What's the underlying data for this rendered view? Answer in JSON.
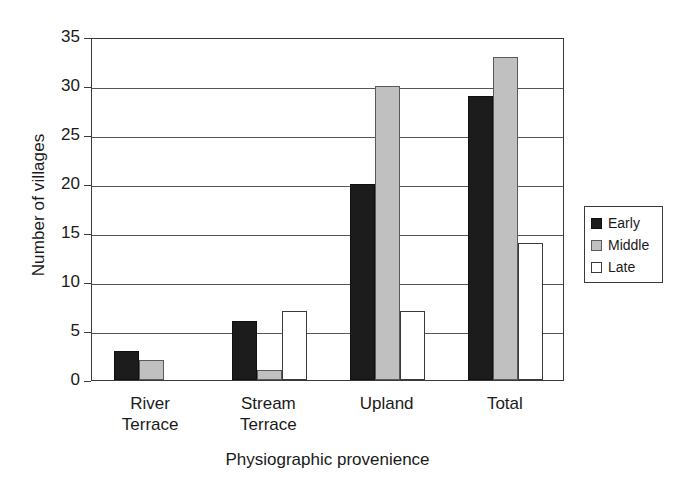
{
  "chart_data": {
    "type": "bar",
    "title": "",
    "xlabel": "Physiographic provenience",
    "ylabel": "Number of villages",
    "categories": [
      "River\nTerrace",
      "Stream\nTerrace",
      "Upland",
      "Total"
    ],
    "series": [
      {
        "name": "Early",
        "values": [
          3,
          6,
          20,
          29
        ]
      },
      {
        "name": "Middle",
        "values": [
          2,
          1,
          30,
          33
        ]
      },
      {
        "name": "Late",
        "values": [
          0,
          7,
          7,
          14
        ]
      }
    ],
    "ylim": [
      0,
      35
    ],
    "yticks": [
      0,
      5,
      10,
      15,
      20,
      25,
      30,
      35
    ],
    "ytick_labels": [
      "0",
      "5",
      "10",
      "15",
      "20",
      "25",
      "30",
      "35"
    ],
    "grid": "horizontal",
    "legend_position": "right",
    "colors": {
      "early": "#1c1c1c",
      "middle": "#c0c0c0",
      "late": "#ffffff",
      "axis": "#3a3a3a",
      "grid": "#555555",
      "background": "#ffffff"
    }
  }
}
